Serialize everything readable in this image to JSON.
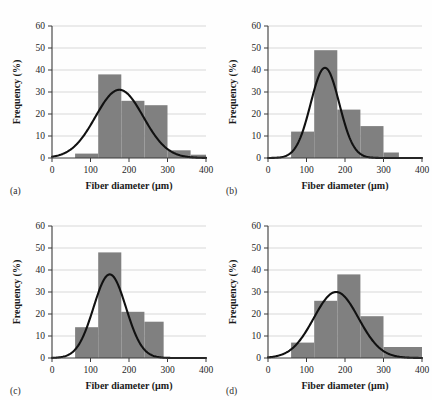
{
  "figure": {
    "background_color": "#fefefe",
    "bar_color": "#808080",
    "curve_color": "#111111",
    "grid_color": "#c9c9c9",
    "axis_color": "#3a3a3a",
    "panel_tags": [
      "(a)",
      "(b)",
      "(c)",
      "(d)"
    ]
  },
  "axes": {
    "xlabel": "Fiber diameter (µm)",
    "ylabel": "Frequency (%)",
    "xticks": [
      "0",
      "100",
      "200",
      "300",
      "400"
    ],
    "yticks": [
      "0",
      "10",
      "20",
      "30",
      "40",
      "50",
      "60"
    ],
    "xlim": [
      0,
      400
    ],
    "ylim": [
      0,
      60
    ]
  },
  "chart_data": [
    {
      "type": "bar",
      "title": "(a)",
      "xlabel": "Fiber diameter (µm)",
      "ylabel": "Frequency (%)",
      "xlim": [
        0,
        400
      ],
      "ylim": [
        0,
        60
      ],
      "xticks": [
        0,
        100,
        200,
        300,
        400
      ],
      "yticks": [
        0,
        10,
        20,
        30,
        40,
        50,
        60
      ],
      "grid": "horizontal",
      "legend": "none",
      "bin_width": 60,
      "bin_edges": [
        60,
        120,
        180,
        240,
        300,
        360,
        400
      ],
      "categories": [
        "60-120",
        "120-180",
        "180-240",
        "240-300",
        "300-360",
        "360-400"
      ],
      "values": [
        2,
        38,
        26,
        24,
        3.5,
        1.5
      ],
      "overlay": {
        "type": "line",
        "name": "Gaussian fit",
        "mean": 175,
        "sigma": 62,
        "peak": 31
      }
    },
    {
      "type": "bar",
      "title": "(b)",
      "xlabel": "Fiber diameter (µm)",
      "ylabel": "Frequency (%)",
      "xlim": [
        0,
        400
      ],
      "ylim": [
        0,
        60
      ],
      "xticks": [
        0,
        100,
        200,
        300,
        400
      ],
      "yticks": [
        0,
        10,
        20,
        30,
        40,
        50,
        60
      ],
      "grid": "horizontal",
      "legend": "none",
      "bin_width": 60,
      "bin_edges": [
        60,
        120,
        180,
        240,
        300,
        340
      ],
      "categories": [
        "60-120",
        "120-180",
        "180-240",
        "240-300",
        "300-340"
      ],
      "values": [
        12,
        49,
        22,
        14.5,
        2.5
      ],
      "overlay": {
        "type": "line",
        "name": "Gaussian fit",
        "mean": 148,
        "sigma": 37,
        "peak": 41
      }
    },
    {
      "type": "bar",
      "title": "(c)",
      "xlabel": "Fiber diameter (µm)",
      "ylabel": "Frequency (%)",
      "xlim": [
        0,
        400
      ],
      "ylim": [
        0,
        60
      ],
      "xticks": [
        0,
        100,
        200,
        300,
        400
      ],
      "yticks": [
        0,
        10,
        20,
        30,
        40,
        50,
        60
      ],
      "grid": "horizontal",
      "legend": "none",
      "bin_width": 60,
      "bin_edges": [
        60,
        120,
        180,
        240,
        290
      ],
      "categories": [
        "60-120",
        "120-180",
        "180-240",
        "240-290"
      ],
      "values": [
        14,
        48,
        21,
        16.5
      ],
      "overlay": {
        "type": "line",
        "name": "Gaussian fit",
        "mean": 150,
        "sigma": 42,
        "peak": 38
      }
    },
    {
      "type": "bar",
      "title": "(d)",
      "xlabel": "Fiber diameter (µm)",
      "ylabel": "Frequency (%)",
      "xlim": [
        0,
        400
      ],
      "ylim": [
        0,
        60
      ],
      "xticks": [
        0,
        100,
        200,
        300,
        400
      ],
      "yticks": [
        0,
        10,
        20,
        30,
        40,
        50,
        60
      ],
      "grid": "horizontal",
      "legend": "none",
      "bin_width": 60,
      "bin_edges": [
        60,
        120,
        180,
        240,
        300,
        400
      ],
      "categories": [
        "60-120",
        "120-180",
        "180-240",
        "240-300",
        "300-400"
      ],
      "values": [
        7,
        26,
        38,
        19,
        5
      ],
      "overlay": {
        "type": "line",
        "name": "Gaussian fit",
        "mean": 177,
        "sigma": 58,
        "peak": 30
      }
    }
  ]
}
